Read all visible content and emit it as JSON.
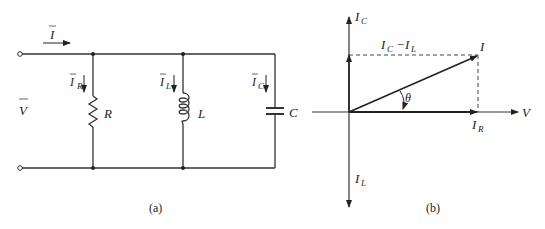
{
  "circuit": {
    "caption": "(a)",
    "source_current": {
      "symbol": "I",
      "bar": true
    },
    "voltage": {
      "symbol": "V",
      "bar": true
    },
    "branches": [
      {
        "id": "resistor",
        "current": {
          "symbol": "I",
          "sub": "R"
        },
        "label": "R"
      },
      {
        "id": "inductor",
        "current": {
          "symbol": "I",
          "sub": "L"
        },
        "label": "L"
      },
      {
        "id": "capacitor",
        "current": {
          "symbol": "I",
          "sub": "C"
        },
        "label": "C"
      }
    ]
  },
  "phasor": {
    "caption": "(b)",
    "axes": {
      "horizontal": "V",
      "up": {
        "symbol": "I",
        "sub": "C"
      },
      "down": {
        "symbol": "I",
        "sub": "L"
      }
    },
    "resultant": "I",
    "difference": {
      "a": "I",
      "a_sub": "C",
      "op": "−",
      "b": "I",
      "b_sub": "L"
    },
    "real_component": {
      "symbol": "I",
      "sub": "R"
    },
    "angle": "θ"
  }
}
